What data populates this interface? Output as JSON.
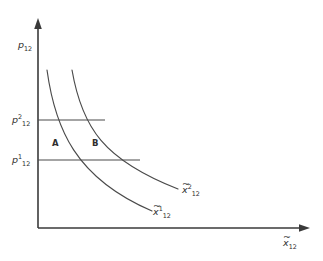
{
  "figure": {
    "type": "economics-diagram",
    "background_color": "#ffffff",
    "line_color": "#4a4a4a",
    "axis_color": "#3a3a3a",
    "text_color": "#2e2e2e"
  },
  "axes": {
    "y_axis": {
      "label_base": "p",
      "label_sub": "12",
      "label_full": "p12",
      "name": "price-axis"
    },
    "x_axis": {
      "label_base": "x",
      "label_sub": "12",
      "label_full": "x12",
      "has_tilde": true,
      "name": "quantity-axis"
    }
  },
  "price_levels": [
    {
      "id": "p2",
      "base": "p",
      "superscript": "2",
      "subscript": "12",
      "y_pixel": 120,
      "line_end_x": 105
    },
    {
      "id": "p1",
      "base": "p",
      "superscript": "1",
      "subscript": "12",
      "y_pixel": 160,
      "line_end_x": 140
    }
  ],
  "curves": [
    {
      "id": "curve-1",
      "base": "x",
      "superscript": "1",
      "subscript": "12",
      "has_tilde": true,
      "label_x": 152,
      "label_y": 215,
      "path": "M 47,70 C 55,128 75,178 152,211"
    },
    {
      "id": "curve-2",
      "base": "x",
      "superscript": "2",
      "subscript": "12",
      "has_tilde": true,
      "label_x": 181,
      "label_y": 193,
      "path": "M 72,70 C 82,128 104,160 178,189"
    }
  ],
  "regions": [
    {
      "label": "A",
      "x": 52,
      "y": 146
    },
    {
      "label": "B",
      "x": 92,
      "y": 146
    }
  ]
}
